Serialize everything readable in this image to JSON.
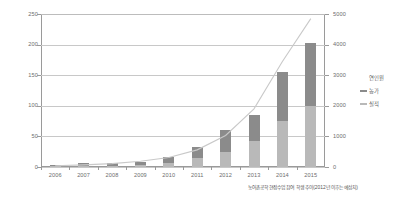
{
  "chart_data": {
    "type": "bar",
    "title": "",
    "subtitle": "",
    "xlabel": "",
    "ylabel": "",
    "categories": [
      "2006",
      "2007",
      "2008",
      "2009",
      "2010",
      "2011",
      "2012",
      "2013",
      "2014",
      "2015"
    ],
    "series": [
      {
        "name": "실적",
        "kind": "bar",
        "stack": "total",
        "axis": "left",
        "color": "#b9b9b9",
        "values": [
          1,
          2,
          2,
          3,
          6,
          14,
          24,
          43,
          76,
          100
        ]
      },
      {
        "name": "농가",
        "kind": "bar",
        "stack": "total",
        "axis": "left",
        "color": "#8b8b8b",
        "values": [
          2,
          4,
          4,
          6,
          10,
          18,
          36,
          42,
          79,
          103
        ]
      },
      {
        "name": "연인원",
        "kind": "line",
        "axis": "right",
        "color": "#c9c9c9",
        "values": [
          40,
          70,
          110,
          190,
          310,
          560,
          1030,
          1900,
          3450,
          4850
        ]
      }
    ],
    "y_axis_left": {
      "ticks": [
        "0",
        "50",
        "100",
        "150",
        "200",
        "250"
      ],
      "ylim": [
        0,
        250
      ]
    },
    "y_axis_right": {
      "ticks": [
        "0",
        "1000",
        "2000",
        "3000",
        "4000",
        "5000"
      ],
      "ylim": [
        0,
        5000
      ]
    },
    "grid": true,
    "legend_position": "right",
    "legend": {
      "title": "연인원",
      "entries": [
        {
          "label": "농가",
          "color": "#8b8b8b"
        },
        {
          "label": "실적",
          "color": "#b9b9b9"
        }
      ]
    },
    "caption": "농어촌공학 현장수업 참여 학생 추이(2012년 이후는 예상치)"
  }
}
